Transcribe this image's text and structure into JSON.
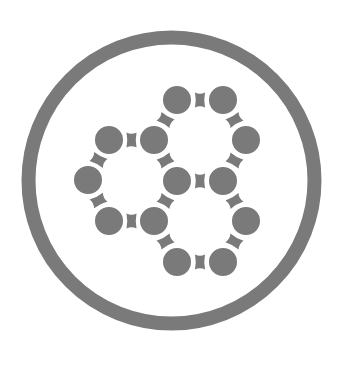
{
  "icon": {
    "name": "molecule-hexagon-ring-icon",
    "background": "#ffffff",
    "color": "#7a7a7a",
    "ring": {
      "cx": 171.5,
      "cy": 180.5,
      "r": 143,
      "stroke_width": 14
    },
    "node_radius": 15,
    "nodes": [
      {
        "x": 177,
        "y": 100
      },
      {
        "x": 223,
        "y": 100
      },
      {
        "x": 109,
        "y": 140
      },
      {
        "x": 154,
        "y": 140
      },
      {
        "x": 246,
        "y": 140
      },
      {
        "x": 88,
        "y": 180
      },
      {
        "x": 177,
        "y": 181
      },
      {
        "x": 223,
        "y": 181
      },
      {
        "x": 109,
        "y": 221
      },
      {
        "x": 154,
        "y": 221
      },
      {
        "x": 246,
        "y": 221
      },
      {
        "x": 177,
        "y": 262
      },
      {
        "x": 223,
        "y": 262
      }
    ],
    "bonds": [
      [
        0,
        1
      ],
      [
        0,
        3
      ],
      [
        1,
        4
      ],
      [
        3,
        6
      ],
      [
        4,
        7
      ],
      [
        6,
        7
      ],
      [
        2,
        3
      ],
      [
        2,
        5
      ],
      [
        5,
        8
      ],
      [
        8,
        9
      ],
      [
        9,
        6
      ],
      [
        9,
        11
      ],
      [
        11,
        12
      ],
      [
        12,
        10
      ],
      [
        10,
        7
      ]
    ]
  }
}
